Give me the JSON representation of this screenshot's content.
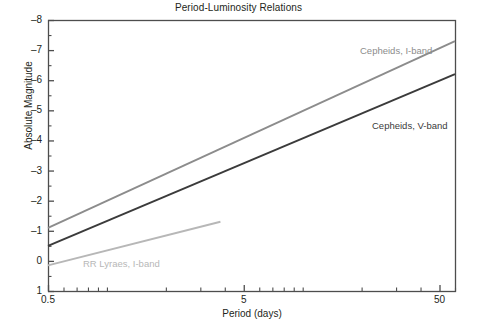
{
  "chart_data": {
    "type": "line",
    "title": "Period-Luminosity Relations",
    "xlabel": "Period (days)",
    "ylabel": "Absolute Magnitude",
    "xscale": "log",
    "yscale": "linear",
    "xlim": [
      0.5,
      60
    ],
    "ylim": [
      1,
      -8
    ],
    "y_inverted": true,
    "grid": false,
    "legend": "inline-annotations",
    "yticks": [
      -8,
      -7,
      -6,
      -5,
      -4,
      -3,
      -2,
      -1,
      0,
      1
    ],
    "ytick_labels": [
      "–8",
      "–7",
      "–6",
      "–5",
      "–4",
      "–3",
      "–2",
      "–1",
      "0",
      "1"
    ],
    "xticks": [
      0.5,
      5,
      50
    ],
    "xtick_labels": [
      "0.5",
      "5",
      "50"
    ],
    "xminor_ticks": [
      0.6,
      0.7,
      0.8,
      0.9,
      1,
      2,
      3,
      4,
      6,
      7,
      8,
      9,
      10,
      20,
      30,
      40,
      60
    ],
    "series": [
      {
        "name": "Cepheids, I-band",
        "color": "#8c8c8c",
        "label": "Cepheids, I-band",
        "points": [
          [
            0.5,
            -1.1
          ],
          [
            60.0,
            -7.3
          ]
        ]
      },
      {
        "name": "Cepheids, V-band",
        "color": "#3b3b3b",
        "label": "Cepheids, V-band",
        "points": [
          [
            0.5,
            -0.5
          ],
          [
            60.0,
            -6.2
          ]
        ]
      },
      {
        "name": "RR Lyraes, I-band",
        "color": "#b7b7b7",
        "label": "RR Lyraes, I-band",
        "points": [
          [
            0.5,
            0.15
          ],
          [
            3.8,
            -1.3
          ]
        ]
      }
    ],
    "annotations": [
      {
        "text": "Cepheids, I-band",
        "x_px": 360,
        "y_px": 45,
        "color": "#8c8c8c"
      },
      {
        "text": "Cepheids, V-band",
        "x_px": 372,
        "y_px": 120,
        "color": "#3b3b3b"
      },
      {
        "text": "RR Lyraes, I-band",
        "x_px": 83,
        "y_px": 258,
        "color": "#b7b7b7"
      }
    ]
  },
  "axis_color": "#4d4d4d"
}
